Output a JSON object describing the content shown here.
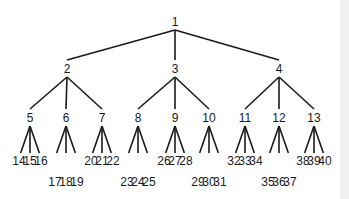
{
  "diagram": {
    "type": "tree",
    "root": "1",
    "levels": [
      [
        "1"
      ],
      [
        "2",
        "3",
        "4"
      ],
      [
        "5",
        "6",
        "7",
        "8",
        "9",
        "10",
        "11",
        "12",
        "13"
      ],
      [
        "14",
        "15",
        "16",
        "17",
        "18",
        "19",
        "20",
        "21",
        "22",
        "23",
        "24",
        "25",
        "26",
        "27",
        "28",
        "29",
        "30",
        "31",
        "32",
        "33",
        "34",
        "35",
        "36",
        "37",
        "38",
        "39",
        "40"
      ]
    ],
    "nodes": [
      {
        "id": "1",
        "x": 175,
        "y": 26,
        "children": [
          "2",
          "3",
          "4"
        ]
      },
      {
        "id": "2",
        "x": 67,
        "y": 73,
        "children": [
          "5",
          "6",
          "7"
        ]
      },
      {
        "id": "3",
        "x": 175,
        "y": 73,
        "children": [
          "8",
          "9",
          "10"
        ]
      },
      {
        "id": "4",
        "x": 279,
        "y": 73,
        "children": [
          "11",
          "12",
          "13"
        ]
      },
      {
        "id": "5",
        "x": 30,
        "y": 122,
        "children": [
          "14",
          "15",
          "16"
        ]
      },
      {
        "id": "6",
        "x": 66,
        "y": 122,
        "children": [
          "17",
          "18",
          "19"
        ]
      },
      {
        "id": "7",
        "x": 102,
        "y": 122,
        "children": [
          "20",
          "21",
          "22"
        ]
      },
      {
        "id": "8",
        "x": 138,
        "y": 122,
        "children": [
          "23",
          "24",
          "25"
        ]
      },
      {
        "id": "9",
        "x": 175,
        "y": 122,
        "children": [
          "26",
          "27",
          "28"
        ]
      },
      {
        "id": "10",
        "x": 209,
        "y": 122,
        "children": [
          "29",
          "30",
          "31"
        ]
      },
      {
        "id": "11",
        "x": 245,
        "y": 122,
        "children": [
          "32",
          "33",
          "34"
        ]
      },
      {
        "id": "12",
        "x": 279,
        "y": 122,
        "children": [
          "35",
          "36",
          "37"
        ]
      },
      {
        "id": "13",
        "x": 314,
        "y": 122,
        "children": [
          "38",
          "39",
          "40"
        ]
      }
    ],
    "leaf_groups": [
      {
        "parent": "5",
        "row": "upper",
        "labels": [
          "14",
          "15",
          "16"
        ]
      },
      {
        "parent": "6",
        "row": "lower",
        "labels": [
          "17",
          "18",
          "19"
        ]
      },
      {
        "parent": "7",
        "row": "upper",
        "labels": [
          "20",
          "21",
          "22"
        ]
      },
      {
        "parent": "8",
        "row": "lower",
        "labels": [
          "23",
          "24",
          "25"
        ]
      },
      {
        "parent": "9",
        "row": "upper",
        "labels": [
          "26",
          "27",
          "28"
        ]
      },
      {
        "parent": "10",
        "row": "lower",
        "labels": [
          "29",
          "30",
          "31"
        ]
      },
      {
        "parent": "11",
        "row": "upper",
        "labels": [
          "32",
          "33",
          "34"
        ]
      },
      {
        "parent": "12",
        "row": "lower",
        "labels": [
          "35",
          "36",
          "37"
        ]
      },
      {
        "parent": "13",
        "row": "upper",
        "labels": [
          "38",
          "39",
          "40"
        ]
      }
    ],
    "colors": {
      "line": "#1a1a1a",
      "text": "#1a1a1a",
      "background": "#ffffff",
      "edge_strip": "#f0f0f0"
    }
  }
}
